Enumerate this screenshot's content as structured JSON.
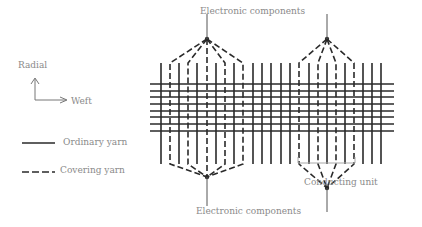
{
  "labels": {
    "top_components": "Electronic components",
    "bottom_components": "Electronic components",
    "conducting_unit": "Conducting unit",
    "axis_radial": "Radial",
    "axis_weft": "Weft",
    "legend_ordinary": "Ordinary yarn",
    "legend_covering": "Covering yarn"
  },
  "colors": {
    "yarn": "#2a2a2a",
    "text": "#8a8a8a",
    "bracket": "#a8a8a8"
  },
  "grid": {
    "vertical_x": [
      161,
      170,
      179,
      188,
      197,
      207,
      216,
      225,
      234,
      243,
      253,
      262,
      271,
      281,
      290,
      299,
      309,
      318,
      327,
      336,
      345,
      354,
      363,
      372,
      381
    ],
    "vertical_top": 63,
    "vertical_bottom": 164,
    "horizontal_y": [
      84,
      91,
      97,
      104,
      111,
      117,
      124,
      131
    ],
    "horizontal_left": 150,
    "horizontal_right": 394,
    "covering_group_left": {
      "apex": [
        207,
        39
      ],
      "bottom_apex": [
        207,
        177
      ],
      "columns": [
        170,
        188,
        207,
        225,
        243
      ]
    },
    "covering_group_right": {
      "apex": [
        327,
        39
      ],
      "bottom_apex": [
        327,
        188
      ],
      "columns": [
        299,
        318,
        336,
        354
      ]
    }
  }
}
